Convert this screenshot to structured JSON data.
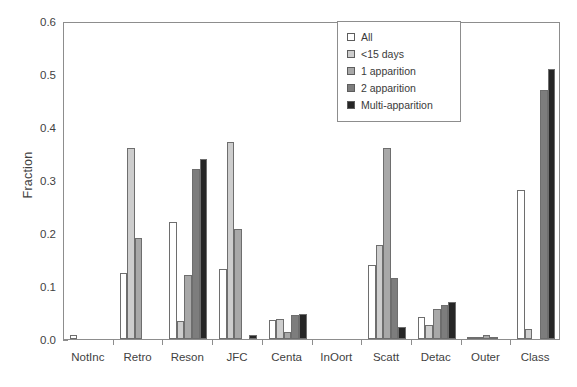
{
  "chart_data": {
    "type": "bar",
    "title": "",
    "xlabel": "",
    "ylabel": "Fraction",
    "ylim": [
      0.0,
      0.6
    ],
    "yticks": [
      "0.0",
      "0.1",
      "0.2",
      "0.3",
      "0.4",
      "0.5",
      "0.6"
    ],
    "ytick_values": [
      0.0,
      0.1,
      0.2,
      0.3,
      0.4,
      0.5,
      0.6
    ],
    "grid": false,
    "legend_position": "top-right",
    "categories": [
      "NotInc",
      "Retro",
      "Reson",
      "JFC",
      "Centa",
      "InOort",
      "Scatt",
      "Detac",
      "Outer",
      "Class"
    ],
    "series": [
      {
        "name": "All",
        "color": "#ffffff",
        "values": [
          0.008,
          0.124,
          0.22,
          0.132,
          0.035,
          0.0,
          0.139,
          0.042,
          0.003,
          0.282
        ]
      },
      {
        "name": "<15 days",
        "color": "#cdcdcd",
        "values": [
          0.0,
          0.36,
          0.034,
          0.372,
          0.038,
          0.0,
          0.177,
          0.026,
          0.002,
          0.018
        ]
      },
      {
        "name": "1 apparition",
        "color": "#a8a8a8",
        "values": [
          0.0,
          0.19,
          0.12,
          0.207,
          0.014,
          0.0,
          0.36,
          0.057,
          0.008,
          0.0
        ]
      },
      {
        "name": "2 apparition",
        "color": "#7d7d7d",
        "values": [
          0.0,
          0.0,
          0.32,
          0.0,
          0.045,
          0.0,
          0.115,
          0.065,
          0.002,
          0.47
        ]
      },
      {
        "name": "Multi-apparition",
        "color": "#262626",
        "values": [
          0.0,
          0.0,
          0.34,
          0.008,
          0.048,
          0.0,
          0.022,
          0.07,
          0.0,
          0.51
        ]
      }
    ]
  },
  "legend": {
    "items": [
      {
        "label": "All"
      },
      {
        "label": "<15 days"
      },
      {
        "label": "1 apparition"
      },
      {
        "label": "2 apparition"
      },
      {
        "label": "Multi-apparition"
      }
    ]
  },
  "axes": {
    "y_title": "Fraction"
  }
}
